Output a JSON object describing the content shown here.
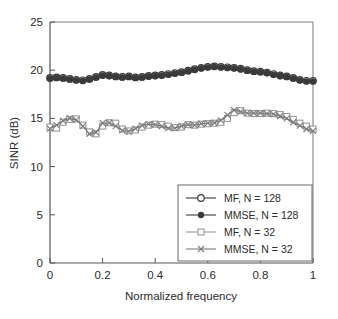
{
  "chart_data": {
    "type": "line",
    "title": "",
    "xlabel": "Normalized frequency",
    "ylabel": "SINR (dB)",
    "xlim": [
      0,
      1
    ],
    "ylim": [
      0,
      25
    ],
    "xticks": [
      0,
      0.2,
      0.4,
      0.6,
      0.8,
      1
    ],
    "xticklabels": [
      "0",
      "0.2",
      "0.4",
      "0.6",
      "0.8",
      "1"
    ],
    "yticks": [
      0,
      5,
      10,
      15,
      20,
      25
    ],
    "yticklabels": [
      "0",
      "5",
      "10",
      "15",
      "20",
      "25"
    ],
    "grid": false,
    "legend_position": "lower right",
    "x": [
      0.0,
      0.025,
      0.05,
      0.075,
      0.1,
      0.125,
      0.15,
      0.175,
      0.2,
      0.225,
      0.25,
      0.275,
      0.3,
      0.325,
      0.35,
      0.375,
      0.4,
      0.425,
      0.45,
      0.475,
      0.5,
      0.525,
      0.55,
      0.575,
      0.6,
      0.625,
      0.65,
      0.675,
      0.7,
      0.725,
      0.75,
      0.775,
      0.8,
      0.825,
      0.85,
      0.875,
      0.9,
      0.925,
      0.95,
      0.975,
      1.0
    ],
    "series": [
      {
        "name": "MF, N = 128",
        "marker": "open-circle",
        "color": "#3a3a3a",
        "values": [
          19.2,
          19.25,
          19.2,
          19.1,
          19.0,
          18.95,
          19.1,
          19.3,
          19.5,
          19.45,
          19.35,
          19.3,
          19.35,
          19.25,
          19.3,
          19.4,
          19.45,
          19.5,
          19.6,
          19.7,
          19.8,
          19.95,
          20.1,
          20.25,
          20.35,
          20.4,
          20.35,
          20.3,
          20.25,
          20.15,
          20.0,
          19.9,
          19.85,
          19.75,
          19.6,
          19.45,
          19.35,
          19.2,
          19.0,
          18.9,
          18.9
        ]
      },
      {
        "name": "MMSE, N = 128",
        "marker": "filled-circle",
        "color": "#3a3a3a",
        "values": [
          19.15,
          19.2,
          19.15,
          19.05,
          18.95,
          18.9,
          19.05,
          19.25,
          19.45,
          19.4,
          19.3,
          19.25,
          19.3,
          19.2,
          19.25,
          19.35,
          19.4,
          19.45,
          19.55,
          19.65,
          19.75,
          19.9,
          20.05,
          20.2,
          20.3,
          20.35,
          20.3,
          20.25,
          20.2,
          20.1,
          19.95,
          19.85,
          19.8,
          19.7,
          19.55,
          19.4,
          19.3,
          19.15,
          18.95,
          18.85,
          18.85
        ]
      },
      {
        "name": "MF, N = 32",
        "marker": "open-square",
        "color": "#9a9a9a",
        "values": [
          14.1,
          14.0,
          14.6,
          14.9,
          14.95,
          14.3,
          13.6,
          13.4,
          14.2,
          14.55,
          14.5,
          13.9,
          13.7,
          13.8,
          14.1,
          14.3,
          14.4,
          14.35,
          14.2,
          14.05,
          14.1,
          14.35,
          14.3,
          14.4,
          14.45,
          14.5,
          14.6,
          15.0,
          15.6,
          15.8,
          15.55,
          15.5,
          15.5,
          15.55,
          15.5,
          15.4,
          15.2,
          14.9,
          14.5,
          14.2,
          13.9
        ]
      },
      {
        "name": "MMSE, N = 32",
        "marker": "cross-x",
        "color": "#7a7a7a",
        "values": [
          13.95,
          14.3,
          14.75,
          15.0,
          14.85,
          14.2,
          13.4,
          13.55,
          14.5,
          14.55,
          14.2,
          13.75,
          13.65,
          13.95,
          14.25,
          14.4,
          14.35,
          14.2,
          14.0,
          14.0,
          14.2,
          14.35,
          14.3,
          14.45,
          14.5,
          14.55,
          14.8,
          15.35,
          15.85,
          15.7,
          15.55,
          15.55,
          15.55,
          15.5,
          15.45,
          15.25,
          15.0,
          14.6,
          14.25,
          13.9,
          13.7
        ]
      }
    ],
    "legend_entries": [
      {
        "label": "MF, N = 128",
        "marker": "open-circle",
        "color": "#3a3a3a"
      },
      {
        "label": "MMSE, N = 128",
        "marker": "filled-circle",
        "color": "#3a3a3a"
      },
      {
        "label": "MF, N = 32",
        "marker": "open-square",
        "color": "#9a9a9a"
      },
      {
        "label": "MMSE, N = 32",
        "marker": "cross-x",
        "color": "#7a7a7a"
      }
    ]
  }
}
